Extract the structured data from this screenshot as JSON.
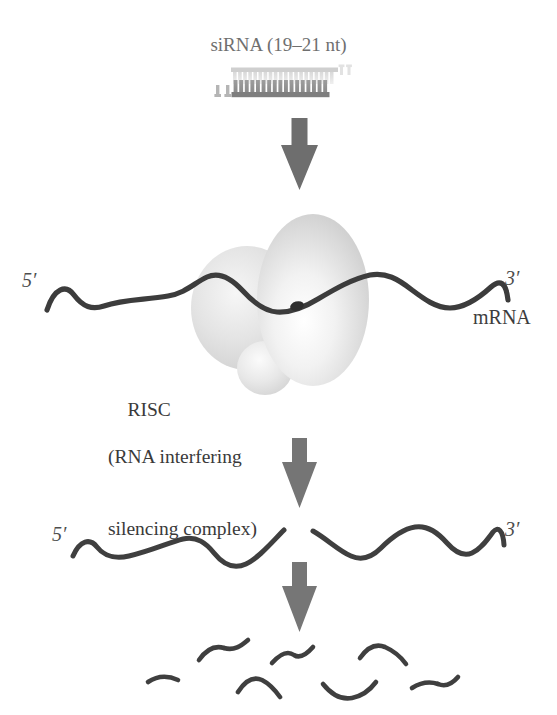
{
  "figure": {
    "title": "siRNA (19–21 nt)",
    "background_color": "#ffffff",
    "ink_color": "#3a3a3a",
    "arrow_color": "#6b6b6b",
    "strand_color": "#3c3c3c",
    "complex_color": "#d8d8d8"
  },
  "labels": {
    "sirna_title": "siRNA (19–21 nt)",
    "five_prime_top": "5′",
    "three_prime_top": "3′",
    "mrna": "mRNA",
    "risc_line1": "RISC",
    "risc_line2": "(RNA interfering",
    "risc_line3": "silencing complex)",
    "five_prime_mid": "5′",
    "three_prime_mid": "3′"
  },
  "stages": [
    {
      "name": "sirna-duplex",
      "description": "siRNA double-stranded ladder with 2-nt 3′ overhangs",
      "rungs": 21
    },
    {
      "name": "risc-loaded-mrna",
      "description": "RISC complex bound to mRNA target strand at cleavage site"
    },
    {
      "name": "cleaved-mrna",
      "description": "mRNA cut into two halves at the cleavage site"
    },
    {
      "name": "degraded-fragments",
      "description": "Short degraded mRNA fragments",
      "fragment_count": 9
    }
  ],
  "arrows": [
    {
      "name": "arrow-sirna-to-risc",
      "x": 299,
      "y_top": 118,
      "y_bottom": 190
    },
    {
      "name": "arrow-risc-to-cleavage",
      "x": 299,
      "y_top": 438,
      "y_bottom": 508
    },
    {
      "name": "arrow-cleavage-to-degradation",
      "x": 299,
      "y_top": 562,
      "y_bottom": 632
    }
  ]
}
